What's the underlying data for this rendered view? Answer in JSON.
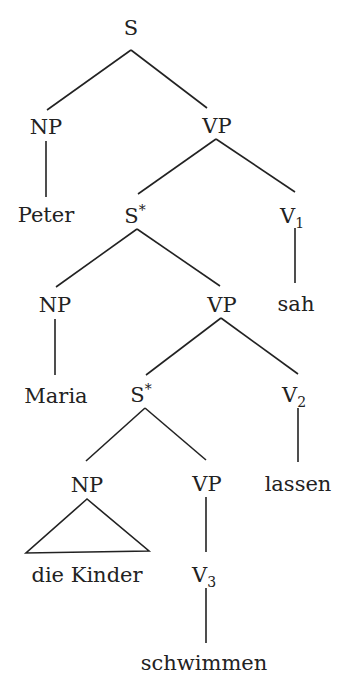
{
  "diagram": {
    "type": "syntax-tree",
    "nodes": [
      {
        "id": "s",
        "label": "S",
        "x": 131,
        "y": 35
      },
      {
        "id": "np1",
        "label": "NP",
        "x": 46,
        "y": 134
      },
      {
        "id": "vp1",
        "label": "VP",
        "x": 217,
        "y": 133
      },
      {
        "id": "peter",
        "label": "Peter",
        "x": 46,
        "y": 222
      },
      {
        "id": "sstar1",
        "label": "S",
        "sup": "*",
        "x": 135,
        "y": 223
      },
      {
        "id": "v1",
        "label": "V",
        "sub": "1",
        "x": 292,
        "y": 223
      },
      {
        "id": "np2",
        "label": "NP",
        "x": 55,
        "y": 312
      },
      {
        "id": "vp2",
        "label": "VP",
        "x": 222,
        "y": 312
      },
      {
        "id": "sah",
        "label": "sah",
        "x": 296,
        "y": 311
      },
      {
        "id": "maria",
        "label": "Maria",
        "x": 56,
        "y": 403
      },
      {
        "id": "sstar2",
        "label": "S",
        "sup": "*",
        "x": 141,
        "y": 402
      },
      {
        "id": "v2",
        "label": "V",
        "sub": "2",
        "x": 294,
        "y": 402
      },
      {
        "id": "np3",
        "label": "NP",
        "x": 87,
        "y": 492
      },
      {
        "id": "vp3",
        "label": "VP",
        "x": 207,
        "y": 491
      },
      {
        "id": "lassen",
        "label": "lassen",
        "x": 298,
        "y": 491
      },
      {
        "id": "diekinder",
        "label": "die Kinder",
        "x": 87,
        "y": 582
      },
      {
        "id": "v3",
        "label": "V",
        "sub": "3",
        "x": 204,
        "y": 582
      },
      {
        "id": "schwimmen",
        "label": "schwimmen",
        "x": 204,
        "y": 670
      }
    ],
    "edges": [
      {
        "from": "s",
        "to": "np1",
        "x1": 131,
        "y1": 50,
        "x2": 47,
        "y2": 110
      },
      {
        "from": "s",
        "to": "vp1",
        "x1": 131,
        "y1": 50,
        "x2": 207,
        "y2": 108
      },
      {
        "from": "np1",
        "to": "peter",
        "x1": 46,
        "y1": 141,
        "x2": 46,
        "y2": 197
      },
      {
        "from": "vp1",
        "to": "sstar1",
        "x1": 216,
        "y1": 139,
        "x2": 138,
        "y2": 194
      },
      {
        "from": "vp1",
        "to": "v1",
        "x1": 216,
        "y1": 139,
        "x2": 295,
        "y2": 192
      },
      {
        "from": "v1",
        "to": "sah",
        "x1": 295,
        "y1": 228,
        "x2": 295,
        "y2": 283
      },
      {
        "from": "sstar1",
        "to": "np2",
        "x1": 137,
        "y1": 229,
        "x2": 56,
        "y2": 287
      },
      {
        "from": "sstar1",
        "to": "vp2",
        "x1": 137,
        "y1": 229,
        "x2": 220,
        "y2": 286
      },
      {
        "from": "np2",
        "to": "maria",
        "x1": 55,
        "y1": 319,
        "x2": 55,
        "y2": 375
      },
      {
        "from": "vp2",
        "to": "sstar2",
        "x1": 221,
        "y1": 318,
        "x2": 146,
        "y2": 375
      },
      {
        "from": "vp2",
        "to": "v2",
        "x1": 221,
        "y1": 318,
        "x2": 298,
        "y2": 374
      },
      {
        "from": "v2",
        "to": "lassen",
        "x1": 298,
        "y1": 408,
        "x2": 298,
        "y2": 462
      },
      {
        "from": "sstar2",
        "to": "np3",
        "x1": 145,
        "y1": 408,
        "x2": 86,
        "y2": 461
      },
      {
        "from": "sstar2",
        "to": "vp3",
        "x1": 145,
        "y1": 408,
        "x2": 206,
        "y2": 460
      },
      {
        "from": "vp3",
        "to": "v3",
        "x1": 206,
        "y1": 497,
        "x2": 206,
        "y2": 552
      },
      {
        "from": "v3",
        "to": "schwimmen",
        "x1": 206,
        "y1": 588,
        "x2": 206,
        "y2": 643
      }
    ],
    "triangle": {
      "apex": [
        87,
        499
      ],
      "left": [
        26,
        553
      ],
      "right": [
        149,
        551
      ]
    }
  }
}
